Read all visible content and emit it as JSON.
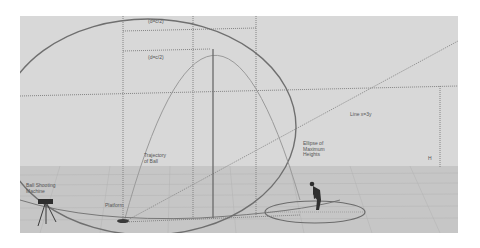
{
  "figure": {
    "background": "#d6d6d6",
    "floor_color": "#c4c4c4",
    "line_color": "#6a6a6a"
  },
  "labels": {
    "d_top": "(d=c/2)",
    "d_mid": "(d=c/2)",
    "line_eq": "Line x=3y",
    "trajectory": "Trajectory\nof Ball",
    "ellipse": "Ellipse of\nMaximum\nHeights",
    "machine": "Ball Shooting\nMachine",
    "platform": "Platform",
    "h_mark": "H"
  },
  "objects": [
    {
      "name": "ball-shooting-machine",
      "type": "tripod"
    },
    {
      "name": "platform",
      "type": "disc"
    },
    {
      "name": "person",
      "type": "figure"
    },
    {
      "name": "ground-ellipse",
      "type": "ellipse"
    },
    {
      "name": "ellipse-of-maximum-heights",
      "type": "ellipse"
    },
    {
      "name": "trajectory-of-ball",
      "type": "parabola"
    }
  ]
}
